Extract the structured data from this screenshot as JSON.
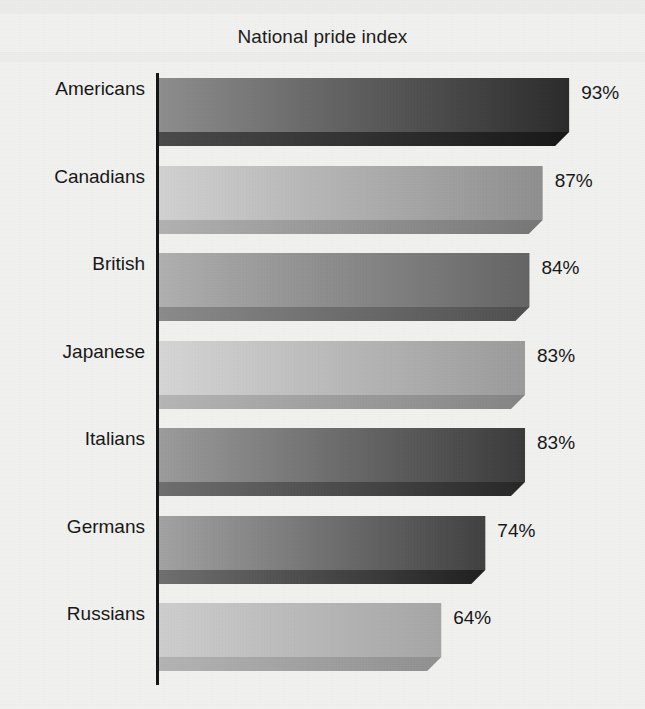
{
  "chart_data": {
    "type": "bar",
    "orientation": "horizontal",
    "title": "National pride index",
    "subtitle": "",
    "xlabel": "",
    "ylabel": "",
    "value_suffix": "%",
    "xlim": [
      0,
      100
    ],
    "grid": false,
    "legend": false,
    "axis_line": "category-axis",
    "style": "3d-extruded-gradient-bars",
    "categories": [
      "Americans",
      "Canadians",
      "British",
      "Japanese",
      "Italians",
      "Germans",
      "Russians"
    ],
    "values": [
      93,
      87,
      84,
      83,
      83,
      74,
      64
    ],
    "value_labels": [
      "93%",
      "87%",
      "84%",
      "83%",
      "83%",
      "74%",
      "64%"
    ],
    "bars": [
      {
        "category": "Americans",
        "value": 93,
        "value_label": "93%",
        "fill_start": "#8e8e8e",
        "fill_end": "#2b2b2b",
        "shadow_start": "#4a4a4a",
        "shadow_end": "#171717"
      },
      {
        "category": "Canadians",
        "value": 87,
        "value_label": "87%",
        "fill_start": "#d2d2d2",
        "fill_end": "#8f8f8f",
        "shadow_start": "#b2b2b2",
        "shadow_end": "#767676"
      },
      {
        "category": "British",
        "value": 84,
        "value_label": "84%",
        "fill_start": "#b0b0b0",
        "fill_end": "#646464",
        "shadow_start": "#8b8b8b",
        "shadow_end": "#4e4e4e"
      },
      {
        "category": "Japanese",
        "value": 83,
        "value_label": "83%",
        "fill_start": "#d6d6d6",
        "fill_end": "#9b9b9b",
        "shadow_start": "#b6b6b6",
        "shadow_end": "#848484"
      },
      {
        "category": "Italians",
        "value": 83,
        "value_label": "83%",
        "fill_start": "#9c9c9c",
        "fill_end": "#3a3a3a",
        "shadow_start": "#6f6f6f",
        "shadow_end": "#262626"
      },
      {
        "category": "Germans",
        "value": 74,
        "value_label": "74%",
        "fill_start": "#a3a3a3",
        "fill_end": "#404040",
        "shadow_start": "#707070",
        "shadow_end": "#1f1f1f"
      },
      {
        "category": "Russians",
        "value": 64,
        "value_label": "64%",
        "fill_start": "#cecece",
        "fill_end": "#a6a6a6",
        "shadow_start": "#b4b4b4",
        "shadow_end": "#909090"
      }
    ],
    "colors": {
      "background": "#f1f1ef",
      "axis": "#141414",
      "text": "#171717",
      "title": "#1b1b1b"
    }
  }
}
